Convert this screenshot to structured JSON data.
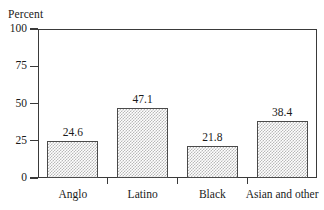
{
  "chart_data": {
    "type": "bar",
    "title": "",
    "xlabel": "",
    "ylabel": "Percent",
    "categories": [
      "Anglo",
      "Latino",
      "Black",
      "Asian and other"
    ],
    "values": [
      24.6,
      47.1,
      21.8,
      38.4
    ],
    "value_labels": [
      "24.6",
      "47.1",
      "21.8",
      "38.4"
    ],
    "ylim": [
      0,
      100
    ],
    "yticks": [
      0,
      25,
      50,
      75,
      100
    ],
    "ytick_labels": [
      "0",
      "25",
      "50",
      "75",
      "100"
    ],
    "grid": false,
    "legend": null,
    "bar_fill": "#b9b9b9",
    "bar_edge": "#4a4a4a",
    "axis_color": "#3a3a3a",
    "background": "#ffffff"
  },
  "axis": {
    "y_title": "Percent"
  }
}
